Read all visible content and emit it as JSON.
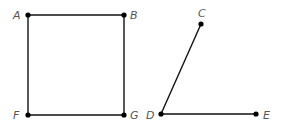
{
  "figures": {
    "square": {
      "label": "Square ABGF",
      "points": {
        "A": {
          "label": "A",
          "x": 28,
          "y": 15
        },
        "B": {
          "label": "B",
          "x": 124,
          "y": 15
        },
        "G": {
          "label": "G",
          "x": 124,
          "y": 115
        },
        "F": {
          "label": "F",
          "x": 28,
          "y": 115
        }
      },
      "segments": [
        "AB",
        "BG",
        "GF",
        "FA"
      ]
    },
    "angle": {
      "label": "Angle CDE",
      "points": {
        "C": {
          "label": "C",
          "x": 201,
          "y": 24
        },
        "D": {
          "label": "D",
          "x": 161,
          "y": 114
        },
        "E": {
          "label": "E",
          "x": 256,
          "y": 114
        }
      },
      "segments": [
        "DC",
        "DE"
      ]
    }
  },
  "colors": {
    "line": "#111111",
    "point": "#000000",
    "label": "#555555",
    "background": "#ffffff"
  }
}
